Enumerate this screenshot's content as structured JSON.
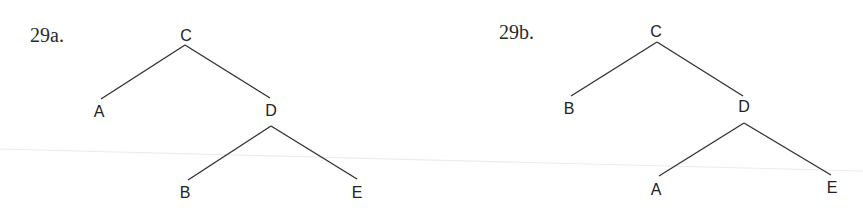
{
  "figures": [
    {
      "label": "29a.",
      "label_pos": [
        30,
        42
      ],
      "nodes": [
        {
          "id": "C",
          "text": "C",
          "x": 186,
          "y": 41
        },
        {
          "id": "A",
          "text": "A",
          "x": 99,
          "y": 117
        },
        {
          "id": "D",
          "text": "D",
          "x": 271,
          "y": 116
        },
        {
          "id": "B",
          "text": "B",
          "x": 185,
          "y": 198
        },
        {
          "id": "E",
          "text": "E",
          "x": 357,
          "y": 198
        }
      ],
      "edges": [
        {
          "from": "C",
          "to": "A",
          "x1": 185,
          "y1": 45,
          "x2": 101,
          "y2": 99
        },
        {
          "from": "C",
          "to": "D",
          "x1": 185,
          "y1": 45,
          "x2": 270,
          "y2": 98
        },
        {
          "from": "D",
          "to": "B",
          "x1": 271,
          "y1": 126,
          "x2": 188,
          "y2": 180
        },
        {
          "from": "D",
          "to": "E",
          "x1": 271,
          "y1": 126,
          "x2": 357,
          "y2": 179
        }
      ]
    },
    {
      "label": "29b.",
      "label_pos": [
        499,
        39
      ],
      "nodes": [
        {
          "id": "C",
          "text": "C",
          "x": 656,
          "y": 37
        },
        {
          "id": "B",
          "text": "B",
          "x": 569,
          "y": 114
        },
        {
          "id": "D",
          "text": "D",
          "x": 744,
          "y": 112
        },
        {
          "id": "A",
          "text": "A",
          "x": 656,
          "y": 195
        },
        {
          "id": "E",
          "text": "E",
          "x": 832,
          "y": 193
        }
      ],
      "edges": [
        {
          "from": "C",
          "to": "B",
          "x1": 657,
          "y1": 42,
          "x2": 571,
          "y2": 96
        },
        {
          "from": "C",
          "to": "D",
          "x1": 657,
          "y1": 42,
          "x2": 743,
          "y2": 96
        },
        {
          "from": "D",
          "to": "A",
          "x1": 744,
          "y1": 123,
          "x2": 659,
          "y2": 176
        },
        {
          "from": "D",
          "to": "E",
          "x1": 744,
          "y1": 123,
          "x2": 831,
          "y2": 175
        }
      ]
    }
  ]
}
